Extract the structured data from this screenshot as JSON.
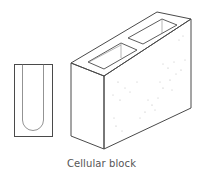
{
  "figure": {
    "caption": "Cellular block",
    "colors": {
      "line": "#4a4a4a",
      "speckle": "#b5b5b5",
      "background": "#ffffff"
    },
    "parts": [
      {
        "name": "cross-section",
        "description": "Section view showing closed-bottom U-shaped cell"
      },
      {
        "name": "block-isometric",
        "description": "Isometric view of block with two cells open at top"
      }
    ]
  }
}
